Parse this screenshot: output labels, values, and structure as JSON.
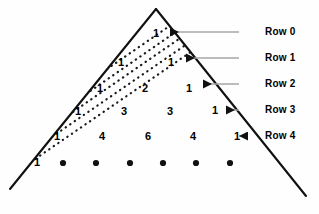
{
  "figure": {
    "kind": "pascals-triangle-diagram",
    "background_color": "#fefefe",
    "outline_color": "#111111",
    "dotted_line_color": "#1a1a1a",
    "leader_line_color": "#a6a6a6",
    "text_color": "#000000"
  },
  "triangle": {
    "apex": {
      "x": 156,
      "y": 9
    },
    "bottom_left": {
      "x": 10,
      "y": 189
    },
    "bottom_right": {
      "x": 306,
      "y": 196
    }
  },
  "chart_data": {
    "type": "table",
    "title": "",
    "rows": [
      {
        "label": "Row 0",
        "values": [
          1
        ]
      },
      {
        "label": "Row 1",
        "values": [
          1,
          1
        ]
      },
      {
        "label": "Row 2",
        "values": [
          1,
          2,
          1
        ]
      },
      {
        "label": "Row 3",
        "values": [
          1,
          3,
          3,
          1
        ]
      },
      {
        "label": "Row 4",
        "values": [
          1,
          4,
          6,
          4,
          1
        ]
      }
    ],
    "partial_row": {
      "label": "",
      "values": [
        1
      ],
      "continuation_dots": 6
    }
  },
  "cells": [
    {
      "text": "1",
      "x": 156,
      "y": 33
    },
    {
      "text": "1",
      "x": 121,
      "y": 62
    },
    {
      "text": "1",
      "x": 171,
      "y": 62
    },
    {
      "text": "1",
      "x": 100,
      "y": 88
    },
    {
      "text": "1",
      "x": 145,
      "y": 88
    },
    {
      "text": "1",
      "x": 189,
      "y": 88
    },
    {
      "text": "1",
      "x": 78,
      "y": 111
    },
    {
      "text": "3",
      "x": 124,
      "y": 111
    },
    {
      "text": "3",
      "x": 170,
      "y": 111
    },
    {
      "text": "1",
      "x": 215,
      "y": 110
    },
    {
      "text": "1",
      "x": 57,
      "y": 136
    },
    {
      "text": "4",
      "x": 102,
      "y": 136
    },
    {
      "text": "6",
      "x": 148,
      "y": 136
    },
    {
      "text": "4",
      "x": 193,
      "y": 136
    },
    {
      "text": "1",
      "x": 237,
      "y": 136
    },
    {
      "text": "1",
      "x": 37,
      "y": 162
    }
  ],
  "cell_overrides": {
    "note": "row 2 middle value is 2",
    "row2_middle": "2"
  },
  "dots": [
    {
      "x": 63,
      "y": 163
    },
    {
      "x": 96,
      "y": 163
    },
    {
      "x": 130,
      "y": 163
    },
    {
      "x": 163,
      "y": 163
    },
    {
      "x": 196,
      "y": 163
    },
    {
      "x": 230,
      "y": 163
    }
  ],
  "row_labels": [
    {
      "text": "Row 0",
      "x": 265,
      "y": 32,
      "leader_from_x": 239,
      "leader_to_x": 170,
      "arrow": true
    },
    {
      "text": "Row 1",
      "x": 265,
      "y": 58,
      "leader_from_x": 239,
      "leader_to_x": 186,
      "arrow": true
    },
    {
      "text": "Row 2",
      "x": 265,
      "y": 84,
      "leader_from_x": 239,
      "leader_to_x": 203,
      "arrow": true
    },
    {
      "text": "Row 3",
      "x": 265,
      "y": 110,
      "leader_from_x": 239,
      "leader_to_x": 226,
      "arrow": true
    },
    {
      "text": "Row 4",
      "x": 265,
      "y": 136,
      "leader_from_x": 239,
      "leader_to_x": 248,
      "arrow": true
    }
  ],
  "dotted_diagonals": [
    {
      "x1": 22,
      "y1": 168,
      "x2": 198,
      "y2": 47
    },
    {
      "x1": 43,
      "y1": 143,
      "x2": 219,
      "y2": 22
    },
    {
      "x1": 64,
      "y1": 118,
      "x2": 240,
      "y2": -3
    },
    {
      "x1": 86,
      "y1": 94,
      "x2": 248,
      "y2": -18
    },
    {
      "x1": 107,
      "y1": 69,
      "x2": 200,
      "y2": 5
    }
  ]
}
